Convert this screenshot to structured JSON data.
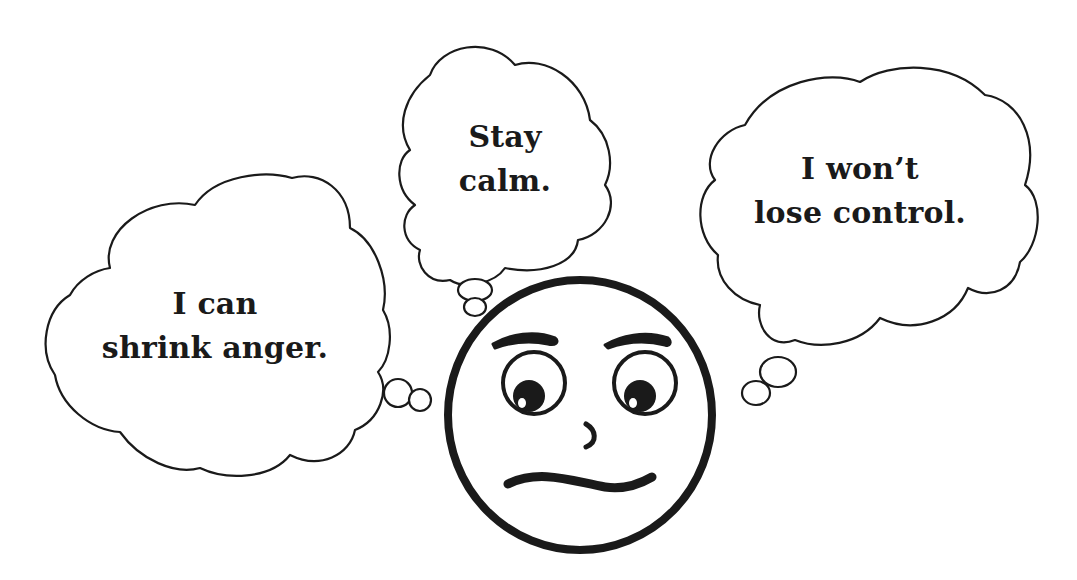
{
  "illustration": {
    "description": "Cartoon face surrounded by three thought clouds with calming self-talk",
    "background_color": "#ffffff",
    "line_color": "#1a1a1a",
    "thoughts": [
      {
        "id": "left",
        "lines": [
          "I can",
          "shrink anger."
        ]
      },
      {
        "id": "middle",
        "lines": [
          "Stay",
          "calm."
        ]
      },
      {
        "id": "right",
        "lines": [
          "I won’t",
          "lose control."
        ]
      }
    ],
    "face": {
      "expression": "worried / uneasy",
      "features": [
        "raised eyebrows",
        "eyes looking down-left",
        "small curved nose",
        "wavy mouth"
      ]
    }
  }
}
